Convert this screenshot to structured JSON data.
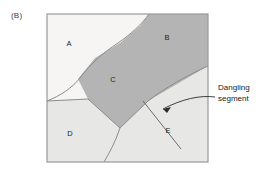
{
  "figure": {
    "panel_label": "(B)",
    "callout": {
      "line1": "Dangling",
      "line2": "segment"
    },
    "regions": [
      {
        "id": "A",
        "label": "A",
        "fill": "#f6f5f3",
        "label_x": 69,
        "label_y": 46
      },
      {
        "id": "B",
        "label": "B",
        "fill": "#b4b4b4",
        "label_x": 167,
        "label_y": 40
      },
      {
        "id": "C",
        "label": "C",
        "fill": "#b4b4b4",
        "label_x": 113,
        "label_y": 82
      },
      {
        "id": "D",
        "label": "D",
        "fill": "#e7e7e5",
        "label_x": 70,
        "label_y": 136
      },
      {
        "id": "E",
        "label": "E",
        "fill": "#e7e7e5",
        "label_x": 168,
        "label_y": 133
      }
    ],
    "frame": {
      "x": 47,
      "y": 14,
      "width": 161,
      "height": 148,
      "stroke": "#9a9a9a",
      "fill": "#efeeec"
    },
    "colors": {
      "dark_region": "#b4b4b4",
      "light_region": "#e7e7e5",
      "white_region": "#f6f5f3",
      "line": "#6e6e6e",
      "text": "#1a1a1a"
    }
  }
}
